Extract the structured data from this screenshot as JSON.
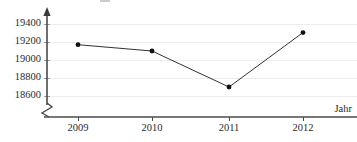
{
  "chart_data": {
    "type": "line",
    "title": "",
    "xlabel": "Jahr",
    "ylabel": "",
    "categories": [
      "2009",
      "2010",
      "2011",
      "2012"
    ],
    "values": [
      19170,
      19100,
      18700,
      19305
    ],
    "ylim": [
      18600,
      19400
    ],
    "ytick_labels": [
      "19400",
      "19200",
      "19000",
      "18800",
      "18600"
    ],
    "ytick_values": [
      19400,
      19200,
      19000,
      18800,
      18600
    ],
    "xtick_labels": [
      "2009",
      "2010",
      "2011",
      "2012"
    ],
    "grid": true,
    "legend": "none",
    "axis_break": true,
    "y_axis_arrow": true,
    "series": [
      {
        "name": "",
        "values": [
          19170,
          19100,
          18700,
          19305
        ]
      }
    ],
    "points": [
      {
        "x": "2009",
        "y": 19170
      },
      {
        "x": "2010",
        "y": 19100
      },
      {
        "x": "2011",
        "y": 18700
      },
      {
        "x": "2012",
        "y": 19305
      }
    ],
    "colors": {
      "line": "#1a1a1a",
      "marker": "#111111",
      "grid": "#ededed",
      "axis": "#4a4a4a",
      "text": "#2b2b2b",
      "background": "#ffffff"
    }
  }
}
